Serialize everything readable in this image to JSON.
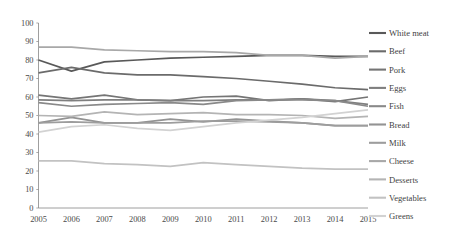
{
  "chart_data": {
    "type": "line",
    "title": "",
    "subtitle": "",
    "xlabel": "",
    "ylabel": "",
    "categories": [
      "2005",
      "2006",
      "2007",
      "2008",
      "2009",
      "2010",
      "2011",
      "2012",
      "2013",
      "2014",
      "2015"
    ],
    "x": [
      2005,
      2006,
      2007,
      2008,
      2009,
      2010,
      2011,
      2012,
      2013,
      2014,
      2015
    ],
    "xlim": [
      2005,
      2015
    ],
    "ylim": [
      0,
      100
    ],
    "yticks": [
      0,
      10,
      20,
      30,
      40,
      50,
      60,
      70,
      80,
      90,
      100
    ],
    "grid": false,
    "legend_position": "right",
    "series": [
      {
        "name": "White meat",
        "color": "#595959",
        "values": [
          80,
          74,
          79,
          80,
          81,
          81.5,
          82,
          82.5,
          82.5,
          82,
          82
        ]
      },
      {
        "name": "Beef",
        "color": "#6b6b6b",
        "values": [
          73,
          76,
          73,
          72,
          72,
          71,
          70,
          68.5,
          67,
          65,
          64
        ]
      },
      {
        "name": "Pork",
        "color": "#757575",
        "values": [
          61,
          59,
          61,
          58.5,
          58,
          60,
          60.5,
          58,
          59,
          57.5,
          60
        ]
      },
      {
        "name": "Eggs",
        "color": "#7f7f7f",
        "values": [
          58.5,
          58,
          58.5,
          58.5,
          58,
          58,
          58.5,
          58.5,
          59,
          58,
          56
        ]
      },
      {
        "name": "Fish",
        "color": "#898989",
        "values": [
          57,
          55,
          56,
          56.5,
          57,
          56,
          58,
          58.5,
          58.5,
          58,
          55
        ]
      },
      {
        "name": "Bread",
        "color": "#939393",
        "values": [
          46,
          49,
          46,
          46,
          48,
          46.5,
          48,
          47,
          46,
          44.5,
          44.5
        ]
      },
      {
        "name": "Milk",
        "color": "#9d9d9d",
        "values": [
          46,
          46.5,
          46,
          46,
          46,
          47,
          47,
          46.5,
          46,
          44.5,
          44.5
        ]
      },
      {
        "name": "Cheese",
        "color": "#a8a8a8",
        "values": [
          87,
          87,
          85.5,
          85,
          84.5,
          84.5,
          84,
          82.5,
          82.5,
          81,
          82
        ]
      },
      {
        "name": "Desserts",
        "color": "#b4b4b4",
        "values": [
          50,
          49.5,
          52,
          50.5,
          51,
          51.5,
          50.5,
          50.5,
          50,
          48.5,
          49.5
        ]
      },
      {
        "name": "Vegetables",
        "color": "#c2c2c2",
        "values": [
          25.5,
          25.5,
          24,
          23.5,
          22.5,
          24.5,
          23.5,
          22.5,
          21.5,
          21,
          21
        ]
      },
      {
        "name": "Greens",
        "color": "#d2d2d2",
        "values": [
          41,
          44,
          45,
          43,
          42,
          44,
          46,
          47.5,
          49,
          51,
          53
        ]
      }
    ]
  },
  "legend": {
    "entries": [
      {
        "label": "White meat"
      },
      {
        "label": "Beef"
      },
      {
        "label": "Pork"
      },
      {
        "label": "Eggs"
      },
      {
        "label": "Fish"
      },
      {
        "label": "Bread"
      },
      {
        "label": "Milk"
      },
      {
        "label": "Cheese"
      },
      {
        "label": "Desserts"
      },
      {
        "label": "Vegetables"
      },
      {
        "label": "Greens"
      }
    ]
  },
  "axes": {
    "y_tick_labels": [
      "100",
      "90",
      "80",
      "70",
      "60",
      "50",
      "40",
      "30",
      "20",
      "10",
      "0"
    ],
    "x_tick_labels": [
      "2005",
      "2006",
      "2007",
      "2008",
      "2009",
      "2010",
      "2011",
      "2012",
      "2013",
      "2014",
      "2015"
    ]
  },
  "colors": {
    "axis": "#868686",
    "text": "#3f3f3f",
    "background": "#ffffff"
  }
}
